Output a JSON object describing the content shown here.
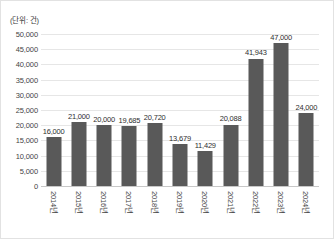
{
  "chart_data": {
    "type": "bar",
    "title": "",
    "subtitle": "",
    "unit_label": "(단위: 건)",
    "xlabel": "",
    "ylabel": "",
    "categories": [
      "2014년",
      "2015년",
      "2016년",
      "2017년",
      "2018년",
      "2019년",
      "2020년",
      "2021년",
      "2022년",
      "2023년",
      "2024년"
    ],
    "values": [
      16000,
      21000,
      20000,
      19685,
      20720,
      13679,
      11429,
      20088,
      41943,
      47000,
      24000
    ],
    "value_labels": [
      "16,000",
      "21,000",
      "20,000",
      "19,685",
      "20,720",
      "13,679",
      "11,429",
      "20,088",
      "41,943",
      "47,000",
      "24,000"
    ],
    "ylim": [
      0,
      50000
    ],
    "ytick_values": [
      0,
      5000,
      10000,
      15000,
      20000,
      25000,
      30000,
      35000,
      40000,
      45000,
      50000
    ],
    "ytick_labels": [
      "0",
      "5,000",
      "10,000",
      "15,000",
      "20,000",
      "25,000",
      "30,000",
      "35,000",
      "40,000",
      "45,000",
      "50,000"
    ],
    "grid": true,
    "legend": false,
    "legend_position": "none",
    "bar_color": "#595959",
    "gridline_color": "#e6e6e6",
    "axis_color": "#c8c8c8",
    "background_color": "#ffffff",
    "label_rotation_deg": 90
  }
}
